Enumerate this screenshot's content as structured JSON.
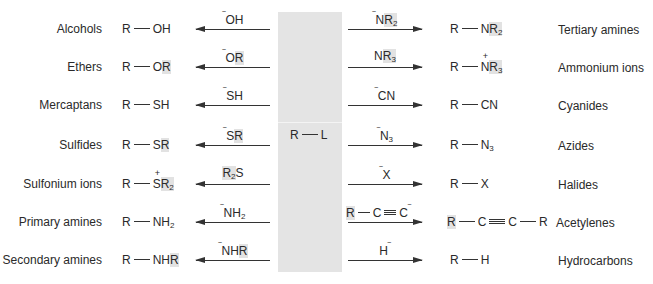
{
  "substrate": {
    "R": "R",
    "L": "L"
  },
  "colors": {
    "center_box": "#e4e4e4",
    "highlight": "#e2e2e2",
    "text": "#2a2a2a"
  },
  "left_rows": [
    {
      "name": "Alcohols",
      "product": [
        "R",
        "OH"
      ],
      "reagent": "⁻OH"
    },
    {
      "name": "Ethers",
      "product": [
        "R",
        "OR"
      ],
      "reagent": "⁻OR"
    },
    {
      "name": "Mercaptans",
      "product": [
        "R",
        "SH"
      ],
      "reagent": "⁻SH"
    },
    {
      "name": "Sulfides",
      "product": [
        "R",
        "SR"
      ],
      "reagent": "⁻SR"
    },
    {
      "name": "Sulfonium ions",
      "product": [
        "R",
        "S⁺R₂"
      ],
      "reagent": "R₂S"
    },
    {
      "name": "Primary amines",
      "product": [
        "R",
        "NH₂"
      ],
      "reagent": "⁻NH₂"
    },
    {
      "name": "Secondary amines",
      "product": [
        "R",
        "NHR"
      ],
      "reagent": "⁻NHR"
    }
  ],
  "right_rows": [
    {
      "name": "Tertiary amines",
      "product": [
        "R",
        "NR₂"
      ],
      "reagent": "⁻NR₂"
    },
    {
      "name": "Ammonium ions",
      "product": [
        "R",
        "N⁺R₃"
      ],
      "reagent": "NR₃"
    },
    {
      "name": "Cyanides",
      "product": [
        "R",
        "CN"
      ],
      "reagent": "⁻CN"
    },
    {
      "name": "Azides",
      "product": [
        "R",
        "N₃"
      ],
      "reagent": "⁻N₃"
    },
    {
      "name": "Halides",
      "product": [
        "R",
        "X"
      ],
      "reagent": "⁻X"
    },
    {
      "name": "Acetylenes",
      "product": [
        "R",
        "C≡C",
        "R"
      ],
      "reagent": "R—C≡C⁻"
    },
    {
      "name": "Hydrocarbons",
      "product": [
        "R",
        "H"
      ],
      "reagent": "H⁻"
    }
  ],
  "labels": {
    "R": "R",
    "OH": "OH",
    "O": "O",
    "S": "S",
    "H": "H",
    "N": "N",
    "C": "C",
    "X": "X",
    "CN": "CN",
    "sub2": "2",
    "sub3": "3",
    "plus": "+",
    "minus": "‾"
  }
}
